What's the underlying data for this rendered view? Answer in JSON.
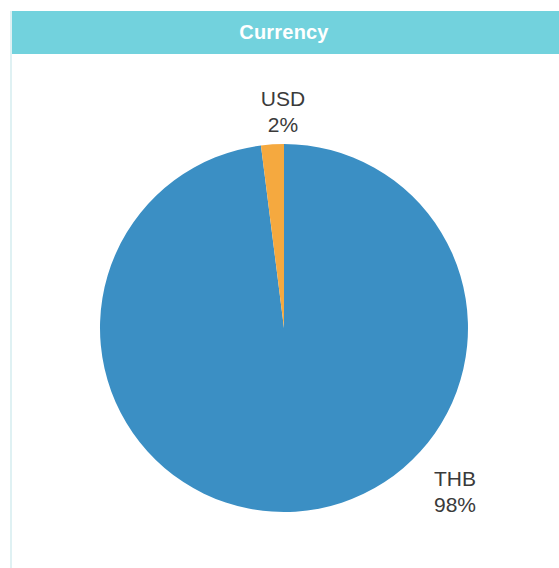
{
  "header": {
    "title": "Currency",
    "band_color": "#72d2dd",
    "title_color": "#ffffff"
  },
  "card": {
    "background": "#ffffff",
    "rule_color": "#dff1f3"
  },
  "chart_data": {
    "type": "pie",
    "title": "Currency",
    "categories": [
      "THB",
      "USD"
    ],
    "values": [
      98,
      2
    ],
    "labels": [
      "98%",
      "2%"
    ],
    "colors": [
      "#3b8fc4",
      "#f5a93f"
    ],
    "legend": "none",
    "data_labels": "outside",
    "start_angle": -7.2,
    "direction": "clockwise",
    "slices": [
      {
        "name": "THB",
        "value": 98,
        "label": "THB",
        "percent_label": "98%",
        "color": "#3b8fc4"
      },
      {
        "name": "USD",
        "value": 2,
        "label": "USD",
        "percent_label": "2%",
        "color": "#f5a93f"
      }
    ],
    "xlabel": "",
    "ylabel": ""
  },
  "geometry": {
    "center_x": 284,
    "center_y": 328,
    "radius": 184
  },
  "icons": {
    "pie_chart": "pie-chart-icon"
  }
}
